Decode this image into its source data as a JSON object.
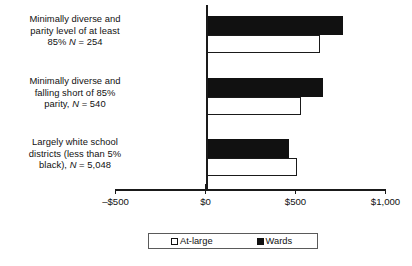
{
  "chart_data": {
    "type": "bar",
    "orientation": "horizontal",
    "title": "",
    "xlabel": "",
    "ylabel": "",
    "xlim": [
      -500,
      1000
    ],
    "xticks": [
      -500,
      0,
      500,
      1000
    ],
    "xtick_labels": [
      "–$500",
      "$0",
      "$500",
      "$1,000"
    ],
    "grid": false,
    "legend_position": "bottom",
    "categories": [
      "Minimally diverse and parity level of at least 85% N = 254",
      "Minimally diverse and falling short of 85% parity, N = 540",
      "Largely white school districts (less than 5% black), N = 5,048"
    ],
    "series": [
      {
        "name": "At-large",
        "color": "#ffffff",
        "values": [
          635,
          533,
          510
        ]
      },
      {
        "name": "Wards",
        "color": "#111111",
        "values": [
          765,
          650,
          465
        ]
      }
    ]
  },
  "categories": [
    {
      "line1": "Minimally diverse and",
      "line2": "parity level of at least",
      "line3_pre": "85% ",
      "line3_n": "N",
      "line3_post": " = 254"
    },
    {
      "line1": "Minimally diverse and",
      "line2": "falling short of 85%",
      "line3_pre": "parity, ",
      "line3_n": "N",
      "line3_post": " = 540"
    },
    {
      "line1": "Largely white school",
      "line2": "districts (less than 5%",
      "line3_pre": "black), ",
      "line3_n": "N",
      "line3_post": " = 5,048"
    }
  ],
  "axis": {
    "tick_labels": [
      "–$500",
      "$0",
      "$500",
      "$1,000"
    ]
  },
  "legend": {
    "items": [
      {
        "label": "At-large",
        "swatch": "white-square-icon"
      },
      {
        "label": "Wards",
        "swatch": "black-square-icon"
      }
    ]
  }
}
